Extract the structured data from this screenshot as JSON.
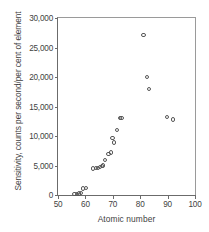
{
  "chart_data": {
    "type": "scatter",
    "title": "",
    "xlabel": "Atomic number",
    "ylabel": "Sensitivity, counts per second/per cent of element",
    "xlim": [
      50,
      100
    ],
    "ylim": [
      0,
      30000
    ],
    "xticks": [
      50,
      60,
      70,
      80,
      90,
      100
    ],
    "xtick_labels": [
      "50",
      "60",
      "70",
      "80",
      "90",
      "100"
    ],
    "yticks": [
      0,
      5000,
      10000,
      15000,
      20000,
      25000,
      30000
    ],
    "ytick_labels": [
      "0",
      "5,000",
      "10,000",
      "15,000",
      "20,000",
      "25,000",
      "30,000"
    ],
    "grid": false,
    "legend": null,
    "marker": "open-circle",
    "marker_color": "#575757",
    "points": [
      {
        "x": 56,
        "y": 150
      },
      {
        "x": 57,
        "y": 200
      },
      {
        "x": 57.6,
        "y": 250
      },
      {
        "x": 58.3,
        "y": 300
      },
      {
        "x": 59.2,
        "y": 1100
      },
      {
        "x": 60.1,
        "y": 1150
      },
      {
        "x": 62.9,
        "y": 4500
      },
      {
        "x": 63.8,
        "y": 4550
      },
      {
        "x": 64.6,
        "y": 4600
      },
      {
        "x": 65.4,
        "y": 4700
      },
      {
        "x": 66.2,
        "y": 4900
      },
      {
        "x": 66.4,
        "y": 5000
      },
      {
        "x": 67.3,
        "y": 6000
      },
      {
        "x": 68.4,
        "y": 6900
      },
      {
        "x": 69.2,
        "y": 7200
      },
      {
        "x": 69.9,
        "y": 9700
      },
      {
        "x": 70.3,
        "y": 8900
      },
      {
        "x": 71.5,
        "y": 11000
      },
      {
        "x": 72.6,
        "y": 13100
      },
      {
        "x": 73.2,
        "y": 13100
      },
      {
        "x": 81.2,
        "y": 27100
      },
      {
        "x": 82.4,
        "y": 20000
      },
      {
        "x": 83.3,
        "y": 18000
      },
      {
        "x": 89.8,
        "y": 13200
      },
      {
        "x": 92.1,
        "y": 12800
      }
    ]
  }
}
